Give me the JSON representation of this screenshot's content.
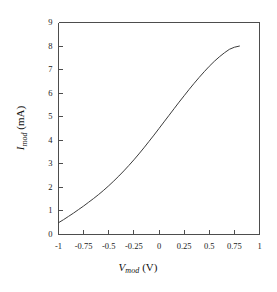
{
  "figure": {
    "background_color": "#ffffff",
    "line_color": "#3c3c3c",
    "axis_color": "#4d4d4d"
  },
  "chart_data": {
    "type": "line",
    "title": "",
    "subtitle": "",
    "xlabel_parts": {
      "symbol": "V",
      "subscript": "mod",
      "unit": "(V)"
    },
    "ylabel_parts": {
      "symbol": "I",
      "subscript": "mod",
      "unit": "(mA)"
    },
    "xlabel": "Vmod (V)",
    "ylabel": "Imod (mA)",
    "xlim": [
      -1,
      1
    ],
    "ylim": [
      0,
      9
    ],
    "grid": false,
    "legend": null,
    "xticks": [
      -1,
      -0.75,
      -0.5,
      -0.25,
      0,
      0.25,
      0.5,
      0.75,
      1
    ],
    "xtick_labels": [
      "-1",
      "-0.75",
      "-0.5",
      "-0.25",
      "0",
      "0.25",
      "0.5",
      "0.75",
      "1"
    ],
    "yticks": [
      0,
      1,
      2,
      3,
      4,
      5,
      6,
      7,
      8,
      9
    ],
    "ytick_labels": [
      "0",
      "1",
      "2",
      "3",
      "4",
      "5",
      "6",
      "7",
      "8",
      "9"
    ],
    "series": [
      {
        "name": "modulator I-V",
        "x": [
          -1.0,
          -0.95,
          -0.9,
          -0.85,
          -0.8,
          -0.75,
          -0.7,
          -0.65,
          -0.6,
          -0.55,
          -0.5,
          -0.45,
          -0.4,
          -0.35,
          -0.3,
          -0.25,
          -0.2,
          -0.15,
          -0.1,
          -0.05,
          0.0,
          0.05,
          0.1,
          0.15,
          0.2,
          0.25,
          0.3,
          0.35,
          0.4,
          0.45,
          0.5,
          0.55,
          0.6,
          0.65,
          0.7,
          0.75,
          0.8
        ],
        "y": [
          0.5,
          0.63,
          0.77,
          0.91,
          1.06,
          1.21,
          1.37,
          1.53,
          1.7,
          1.88,
          2.07,
          2.27,
          2.48,
          2.7,
          2.93,
          3.17,
          3.42,
          3.68,
          3.95,
          4.22,
          4.5,
          4.78,
          5.06,
          5.34,
          5.62,
          5.89,
          6.16,
          6.42,
          6.67,
          6.91,
          7.14,
          7.35,
          7.54,
          7.71,
          7.86,
          7.95,
          8.0
        ]
      }
    ]
  }
}
